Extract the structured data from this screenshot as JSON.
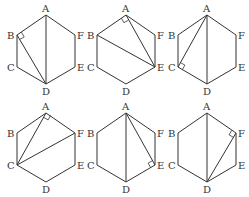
{
  "figure": {
    "vertex_labels": [
      "A",
      "B",
      "C",
      "D",
      "E",
      "F"
    ],
    "colors": {
      "line": "#333333",
      "background": "#ffffff"
    },
    "panels": [
      {
        "id": 1,
        "segments": [
          [
            "A",
            "D"
          ],
          [
            "B",
            "D"
          ]
        ],
        "right_angle_at": "B"
      },
      {
        "id": 2,
        "segments": [
          [
            "B",
            "E"
          ],
          [
            "A",
            "E"
          ]
        ],
        "right_angle_at": "A"
      },
      {
        "id": 3,
        "segments": [
          [
            "A",
            "C"
          ],
          [
            "A",
            "D"
          ]
        ],
        "right_angle_at": "C"
      },
      {
        "id": 4,
        "segments": [
          [
            "A",
            "C"
          ],
          [
            "C",
            "F"
          ]
        ],
        "right_angle_at": "A"
      },
      {
        "id": 5,
        "segments": [
          [
            "A",
            "D"
          ],
          [
            "A",
            "E"
          ]
        ],
        "right_angle_at": "E"
      },
      {
        "id": 6,
        "segments": [
          [
            "A",
            "D"
          ],
          [
            "D",
            "F"
          ]
        ],
        "right_angle_at": "F"
      }
    ]
  }
}
